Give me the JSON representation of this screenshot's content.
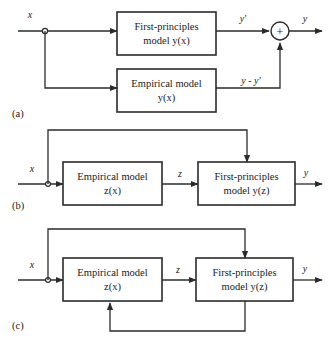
{
  "figure": {
    "line_color": "#2b2b2b",
    "background": "#ffffff"
  },
  "panels": [
    {
      "id": "a",
      "label": "(a)",
      "structure": "parallel",
      "blocks": [
        {
          "name": "first-principles-model",
          "line1": "First-principles",
          "line2": "model y(x)"
        },
        {
          "name": "empirical-model",
          "line1": "Empirical model",
          "line2": "y(x)"
        }
      ],
      "signals": [
        {
          "name": "input-x",
          "label": "x"
        },
        {
          "name": "output-yprime",
          "label": "y′"
        },
        {
          "name": "residual",
          "label": "y - y′"
        },
        {
          "name": "output-y",
          "label": "y"
        }
      ],
      "junction": {
        "name": "summing-junction",
        "label": "+"
      }
    },
    {
      "id": "b",
      "label": "(b)",
      "structure": "serial",
      "blocks": [
        {
          "name": "empirical-model",
          "line1": "Empirical model",
          "line2": "z(x)"
        },
        {
          "name": "first-principles-model",
          "line1": "First-principles",
          "line2": "model y(z)"
        }
      ],
      "signals": [
        {
          "name": "input-x",
          "label": "x"
        },
        {
          "name": "intermediate-z",
          "label": "z"
        },
        {
          "name": "output-y",
          "label": "y"
        }
      ]
    },
    {
      "id": "c",
      "label": "(c)",
      "structure": "serial-with-feedback",
      "blocks": [
        {
          "name": "empirical-model",
          "line1": "Empirical model",
          "line2": "z(x)"
        },
        {
          "name": "first-principles-model",
          "line1": "First-principles",
          "line2": "model y(z)"
        }
      ],
      "signals": [
        {
          "name": "input-x",
          "label": "x"
        },
        {
          "name": "intermediate-z",
          "label": "z"
        },
        {
          "name": "output-y",
          "label": "y"
        }
      ]
    }
  ]
}
